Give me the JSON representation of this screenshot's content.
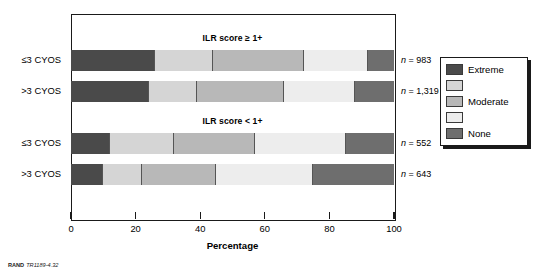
{
  "chart_data": {
    "type": "bar",
    "orientation": "horizontal",
    "stacked": true,
    "stack_unit": "percent",
    "title": "",
    "xlabel": "Percentage",
    "ylabel": "",
    "xlim": [
      0,
      100
    ],
    "xticks": [
      0,
      20,
      40,
      60,
      80,
      100
    ],
    "xtick_labels": [
      "0",
      "20",
      "40",
      "60",
      "80",
      "100"
    ],
    "grid": false,
    "legend_position": "right-outside",
    "series": [
      {
        "name": "Extreme",
        "color": "#4a4a4a",
        "values": [
          26,
          24,
          12,
          10
        ]
      },
      {
        "name": "",
        "color": "#d5d5d5",
        "values": [
          18,
          15,
          20,
          12
        ]
      },
      {
        "name": "Moderate",
        "color": "#b8b8b8",
        "values": [
          28,
          27,
          25,
          23
        ]
      },
      {
        "name": "",
        "color": "#ededed",
        "values": [
          20,
          22,
          28,
          30
        ]
      },
      {
        "name": "None",
        "color": "#6e6e6e",
        "values": [
          8,
          12,
          15,
          25
        ]
      }
    ],
    "categories": [
      "≤3 CYOS",
      ">3 CYOS",
      "≤3 CYOS",
      ">3 CYOS"
    ],
    "groups": [
      {
        "title": "ILR score ≥ 1+",
        "category_indices": [
          0,
          1
        ]
      },
      {
        "title": "ILR score < 1+",
        "category_indices": [
          2,
          3
        ]
      }
    ],
    "annotations": [
      {
        "text": "n = 983",
        "n_value": "983",
        "row": 0
      },
      {
        "text": "n = 1,319",
        "n_value": "1,319",
        "row": 1
      },
      {
        "text": "n = 552",
        "n_value": "552",
        "row": 2
      },
      {
        "text": "n = 643",
        "n_value": "643",
        "row": 3
      }
    ]
  },
  "axis": {
    "x_title": "Percentage",
    "ticks": [
      {
        "label": "0",
        "value": 0
      },
      {
        "label": "20",
        "value": 20
      },
      {
        "label": "40",
        "value": 40
      },
      {
        "label": "60",
        "value": 60
      },
      {
        "label": "80",
        "value": 80
      },
      {
        "label": "100",
        "value": 100
      }
    ]
  },
  "groups": [
    {
      "title": "ILR score ≥ 1+"
    },
    {
      "title": "ILR score < 1+"
    }
  ],
  "rows": [
    {
      "category": "≤3 CYOS",
      "n_prefix": "n",
      "n_eq": "=",
      "n_text": "983",
      "segments": [
        {
          "name": "Extreme",
          "value": 26,
          "color": "#4a4a4a"
        },
        {
          "name": "",
          "value": 18,
          "color": "#d5d5d5"
        },
        {
          "name": "Moderate",
          "value": 28,
          "color": "#b8b8b8"
        },
        {
          "name": "",
          "value": 20,
          "color": "#ededed"
        },
        {
          "name": "None",
          "value": 8,
          "color": "#6e6e6e"
        }
      ]
    },
    {
      "category": ">3 CYOS",
      "n_prefix": "n",
      "n_eq": "=",
      "n_text": "1,319",
      "segments": [
        {
          "name": "Extreme",
          "value": 24,
          "color": "#4a4a4a"
        },
        {
          "name": "",
          "value": 15,
          "color": "#d5d5d5"
        },
        {
          "name": "Moderate",
          "value": 27,
          "color": "#b8b8b8"
        },
        {
          "name": "",
          "value": 22,
          "color": "#ededed"
        },
        {
          "name": "None",
          "value": 12,
          "color": "#6e6e6e"
        }
      ]
    },
    {
      "category": "≤3 CYOS",
      "n_prefix": "n",
      "n_eq": "=",
      "n_text": "552",
      "segments": [
        {
          "name": "Extreme",
          "value": 12,
          "color": "#4a4a4a"
        },
        {
          "name": "",
          "value": 20,
          "color": "#d5d5d5"
        },
        {
          "name": "Moderate",
          "value": 25,
          "color": "#b8b8b8"
        },
        {
          "name": "",
          "value": 28,
          "color": "#ededed"
        },
        {
          "name": "None",
          "value": 15,
          "color": "#6e6e6e"
        }
      ]
    },
    {
      "category": ">3 CYOS",
      "n_prefix": "n",
      "n_eq": "=",
      "n_text": "643",
      "segments": [
        {
          "name": "Extreme",
          "value": 10,
          "color": "#4a4a4a"
        },
        {
          "name": "",
          "value": 12,
          "color": "#d5d5d5"
        },
        {
          "name": "Moderate",
          "value": 23,
          "color": "#b8b8b8"
        },
        {
          "name": "",
          "value": 30,
          "color": "#ededed"
        },
        {
          "name": "None",
          "value": 25,
          "color": "#6e6e6e"
        }
      ]
    }
  ],
  "legend": {
    "items": [
      {
        "label": "Extreme",
        "color": "#4a4a4a"
      },
      {
        "label": "",
        "color": "#d5d5d5"
      },
      {
        "label": "Moderate",
        "color": "#b8b8b8"
      },
      {
        "label": "",
        "color": "#ededed"
      },
      {
        "label": "None",
        "color": "#6e6e6e"
      }
    ]
  },
  "footer": {
    "brand": "RAND",
    "document_id": "TR1189-4.32"
  }
}
